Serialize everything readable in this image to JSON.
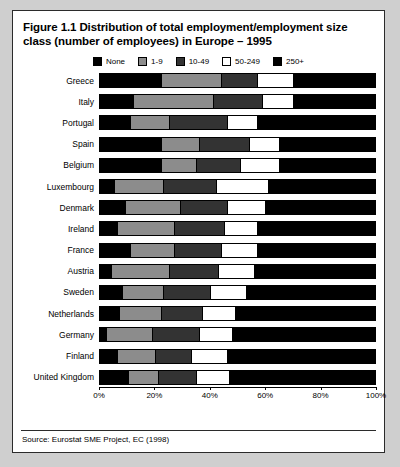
{
  "figure": {
    "title": "Figure 1.1 Distribution of total employment/employment size class (number of employees) in Europe – 1995",
    "source": "Source: Eurostat SME Project, EC (1998)"
  },
  "colors": {
    "none": "#000000",
    "size_1_9": "#8c8c8c",
    "size_10_49": "#333333",
    "size_50_249": "#ffffff",
    "size_250_plus": "#000000",
    "frame": "#2b2b2b",
    "page_background": "#cfcfcf",
    "panel_background": "#ffffff"
  },
  "chart_data": {
    "type": "bar",
    "orientation": "horizontal",
    "stacked": true,
    "normalized": true,
    "title": "Figure 1.1 Distribution of total employment/employment size class (number of employees) in Europe – 1995",
    "xlabel": "",
    "ylabel": "",
    "xlim": [
      0,
      100
    ],
    "xticks": [
      0,
      20,
      40,
      60,
      80,
      100
    ],
    "xticklabels": [
      "0%",
      "20%",
      "40%",
      "60%",
      "80%",
      "100%"
    ],
    "grid": false,
    "legend_position": "top-center",
    "legend": [
      "None",
      "1-9",
      "10-49",
      "50-249",
      "250+"
    ],
    "categories": [
      "Greece",
      "Italy",
      "Portugal",
      "Spain",
      "Belgium",
      "Luxembourg",
      "Denmark",
      "Ireland",
      "France",
      "Austria",
      "Sweden",
      "Netherlands",
      "Germany",
      "Finland",
      "United Kingdom"
    ],
    "series": [
      {
        "name": "None",
        "values": [
          22,
          12,
          11,
          22,
          22,
          5,
          9,
          6,
          11,
          4,
          8,
          7,
          2,
          6,
          10
        ]
      },
      {
        "name": "1-9",
        "values": [
          22,
          29,
          14,
          14,
          13,
          18,
          20,
          21,
          16,
          21,
          15,
          15,
          17,
          14,
          11
        ]
      },
      {
        "name": "10-49",
        "values": [
          13,
          18,
          21,
          18,
          16,
          19,
          17,
          18,
          17,
          18,
          17,
          15,
          17,
          13,
          14
        ]
      },
      {
        "name": "50-249",
        "values": [
          13,
          11,
          11,
          11,
          14,
          19,
          14,
          12,
          13,
          13,
          13,
          12,
          12,
          13,
          12
        ]
      },
      {
        "name": "250+",
        "values": [
          30,
          30,
          43,
          35,
          35,
          39,
          40,
          43,
          43,
          44,
          47,
          51,
          52,
          54,
          53
        ]
      }
    ]
  }
}
